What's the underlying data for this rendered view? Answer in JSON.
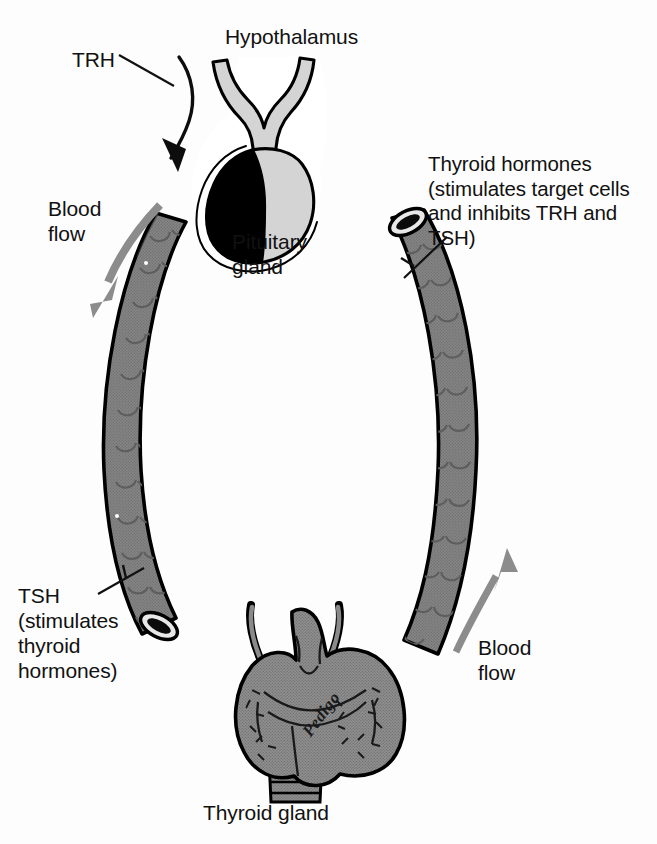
{
  "figure": {
    "background_color": "#fdfdfd"
  },
  "labels": {
    "hypothalamus": "Hypothalamus",
    "trh": "TRH",
    "pituitary_gland": "Pituitary\ngland",
    "blood_flow_left": "Blood\nflow",
    "thyroid_hormones": "Thyroid hormones\n(stimulates target cells\nand inhibits TRH and\nTSH)",
    "tsh": "TSH\n(stimulates\nthyroid\nhormones)",
    "blood_flow_right": "Blood\nflow",
    "thyroid_gland": "Thyroid gland",
    "signature": "Pedigo"
  },
  "structures": [
    {
      "name": "hypothalamus-infundibulum",
      "description": "Y-shaped light grey stalk above the pituitary",
      "fill": "#d4d4d4",
      "stroke": "#000000"
    },
    {
      "name": "pituitary-anterior-lobe",
      "description": "Black anterior lobe of the pituitary gland",
      "fill": "#000000",
      "stroke": "#000000"
    },
    {
      "name": "pituitary-posterior-lobe",
      "description": "Light grey posterior lobe of the pituitary gland",
      "fill": "#d4d4d4",
      "stroke": "#000000"
    },
    {
      "name": "left-blood-vessel",
      "description": "Left arcing blood vessel carrying TSH from pituitary to thyroid, open lumen at lower end",
      "fill": "#838383",
      "stroke": "#000000"
    },
    {
      "name": "right-blood-vessel",
      "description": "Right arcing blood vessel carrying thyroid hormones to target cells, open lumen at upper end",
      "fill": "#838383",
      "stroke": "#000000"
    },
    {
      "name": "thyroid-gland",
      "description": "Bilobed thyroid gland with superior horns and trachea below",
      "fill": "#8a8a8a",
      "stroke": "#000000"
    }
  ],
  "arrows": [
    {
      "name": "trh-arrow",
      "label": "TRH",
      "color": "#0d0d0d",
      "direction": "curves down and right into the pituitary gland"
    },
    {
      "name": "blood-flow-arrow-left",
      "label": "Blood flow",
      "color": "#8c8c8c",
      "direction": "curves down and to the left, away from the pituitary"
    },
    {
      "name": "blood-flow-arrow-right",
      "label": "Blood flow",
      "color": "#8c8c8c",
      "direction": "points up and to the right, away from the thyroid"
    }
  ],
  "leader_lines": [
    {
      "name": "trh-leader-line",
      "from": "TRH",
      "to": "trh-arrow"
    },
    {
      "name": "tsh-leader-line",
      "from": "TSH",
      "to": "left-blood-vessel"
    },
    {
      "name": "thyroid-hormones-leader-line",
      "from": "TSH)",
      "to": "right-blood-vessel"
    }
  ],
  "colors": {
    "ink": "#111111",
    "vessel_grey": "#838383",
    "gland_grey": "#8a8a8a",
    "light_grey": "#d4d4d4",
    "arrow_grey": "#8c8c8c",
    "black": "#000000",
    "paper": "#fdfdfd"
  }
}
